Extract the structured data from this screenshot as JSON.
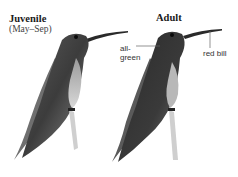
{
  "figure": {
    "juvenile": {
      "title": "Juvenile",
      "subtitle": "(May–Sep)"
    },
    "adult": {
      "title": "Adult",
      "annotations": [
        {
          "text": "all-green"
        },
        {
          "text": "red bill"
        }
      ]
    },
    "colors": {
      "background": "#ffffff",
      "plumage_dark": "#2e2e2e",
      "plumage_mid": "#6b6b6b",
      "text": "#1a1a1a"
    }
  }
}
